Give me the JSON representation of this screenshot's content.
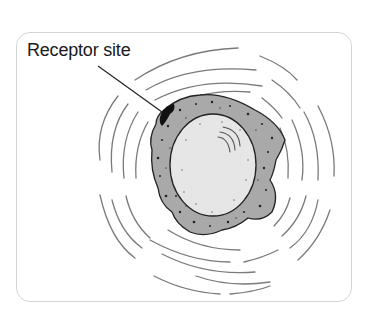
{
  "diagram": {
    "label": "Receptor site",
    "elements": {
      "cell": "cell with granular cytoplasm",
      "nucleus": "nucleus",
      "receptor": "receptor site",
      "waves": "concentric signal waves"
    },
    "colors": {
      "cytoplasm": "#a9a9a9",
      "nucleus": "#e6e6e6",
      "outline": "#222222",
      "waves": "#7a7a7a",
      "receptor": "#111111",
      "frame": "#d4d4d4"
    }
  }
}
